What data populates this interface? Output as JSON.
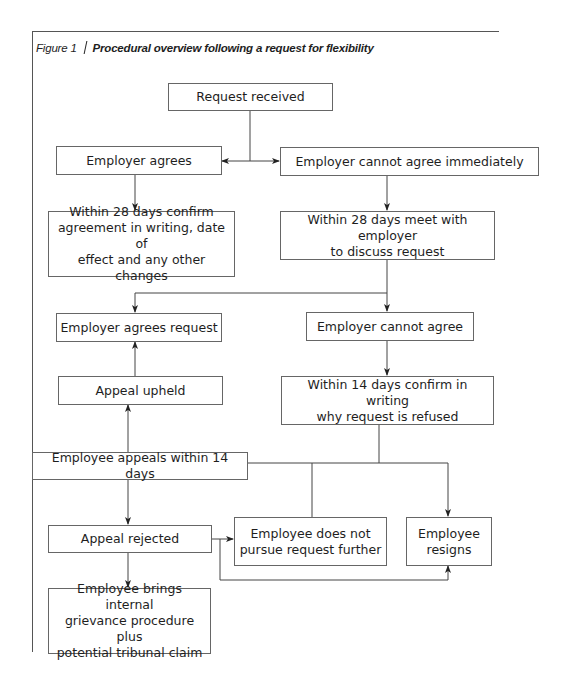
{
  "figure": {
    "number_label": "Figure 1",
    "title": "Procedural overview following a request for flexibility"
  },
  "nodes": {
    "request_received": "Request received",
    "employer_agrees": "Employer agrees",
    "employer_cannot_agree_immediately": "Employer cannot agree immediately",
    "confirm_in_writing_28": "Within 28 days confirm\nagreement in writing, date of\neffect and any other changes",
    "meet_within_28": "Within 28 days meet with\nemployer\nto discuss request",
    "employer_agrees_request": "Employer agrees request",
    "employer_cannot_agree": "Employer cannot agree",
    "appeal_upheld": "Appeal upheld",
    "confirm_refusal_14": "Within 14 days confirm in writing\nwhy request is refused",
    "employee_appeals_14": "Employee appeals within 14 days",
    "appeal_rejected": "Appeal rejected",
    "employee_does_not_pursue": "Employee does not\npursue request further",
    "employee_resigns": "Employee\nresigns",
    "grievance_tribunal": "Employee brings internal\ngrievance procedure plus\npotential tribunal claim"
  },
  "edges": [
    {
      "from": "request_received",
      "to": "employer_agrees"
    },
    {
      "from": "request_received",
      "to": "employer_cannot_agree_immediately"
    },
    {
      "from": "employer_agrees",
      "to": "confirm_in_writing_28"
    },
    {
      "from": "employer_cannot_agree_immediately",
      "to": "meet_within_28"
    },
    {
      "from": "meet_within_28",
      "to": "employer_agrees_request"
    },
    {
      "from": "meet_within_28",
      "to": "employer_cannot_agree"
    },
    {
      "from": "employer_cannot_agree",
      "to": "confirm_refusal_14"
    },
    {
      "from": "confirm_refusal_14",
      "to": "employee_appeals_14"
    },
    {
      "from": "confirm_refusal_14",
      "to": "employee_does_not_pursue"
    },
    {
      "from": "confirm_refusal_14",
      "to": "employee_resigns"
    },
    {
      "from": "employee_appeals_14",
      "to": "appeal_upheld"
    },
    {
      "from": "appeal_upheld",
      "to": "employer_agrees_request"
    },
    {
      "from": "employee_appeals_14",
      "to": "appeal_rejected"
    },
    {
      "from": "appeal_rejected",
      "to": "employee_does_not_pursue"
    },
    {
      "from": "appeal_rejected",
      "to": "employee_resigns"
    },
    {
      "from": "appeal_rejected",
      "to": "grievance_tribunal"
    }
  ]
}
